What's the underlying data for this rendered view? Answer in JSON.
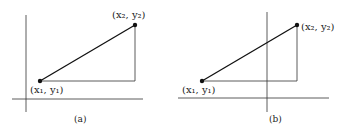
{
  "panels": [
    {
      "caption": "(a)",
      "p1_label": "(x₁, y₁)",
      "p2_label": "(x₂, y₂)"
    },
    {
      "caption": "(b)",
      "p1_label": "(x₁, y₁)",
      "p2_label": "(x₂, y₂)"
    }
  ],
  "colors": {
    "line": "#222222",
    "point": "#111111"
  }
}
